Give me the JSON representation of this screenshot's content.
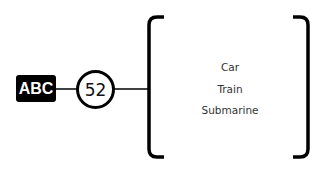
{
  "diagram": {
    "source_node": {
      "label": "ABC",
      "fill": "#000000",
      "text_color": "#ffffff"
    },
    "count_node": {
      "label": "52",
      "stroke": "#000000"
    },
    "list_items": [
      "Car",
      "Train",
      "Submarine"
    ],
    "line_color": "#000000",
    "text_color": "#333333"
  }
}
